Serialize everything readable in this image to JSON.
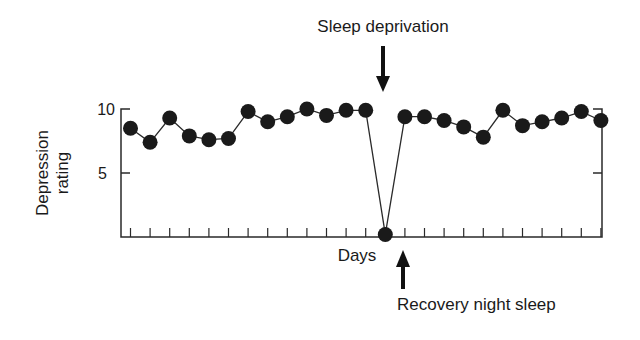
{
  "chart_data": {
    "type": "line",
    "title": "",
    "xlabel": "Days",
    "ylabel": "Depression rating",
    "yticks": [
      5,
      10
    ],
    "ylim": [
      0,
      10.5
    ],
    "grid": false,
    "legend": null,
    "x": [
      1,
      2,
      3,
      4,
      5,
      6,
      7,
      8,
      9,
      10,
      11,
      12,
      13,
      14,
      15,
      16,
      17,
      18,
      19,
      20,
      21,
      22,
      23,
      24,
      25
    ],
    "values": [
      8.5,
      7.4,
      9.3,
      7.9,
      7.6,
      7.7,
      9.8,
      9.0,
      9.4,
      10.0,
      9.5,
      9.9,
      9.9,
      0.2,
      9.4,
      9.4,
      9.1,
      8.6,
      7.8,
      9.9,
      8.7,
      9.0,
      9.3,
      9.8,
      9.1
    ],
    "annotations": [
      {
        "text": "Sleep deprivation",
        "arrow": "down",
        "at_day": 14,
        "position": "above"
      },
      {
        "text": "Recovery night sleep",
        "arrow": "up",
        "at_day": 15,
        "position": "below"
      }
    ]
  },
  "labels": {
    "ylabel_line1": "Depression",
    "ylabel_line2": "rating",
    "xlabel": "Days",
    "ytick_10": "10",
    "ytick_5": "5",
    "annotation_top": "Sleep deprivation",
    "annotation_bottom": "Recovery night sleep"
  },
  "style": {
    "marker_color": "#1a1a1a",
    "line_color": "#2a2a2a",
    "axis_color": "#2a2a2a"
  }
}
